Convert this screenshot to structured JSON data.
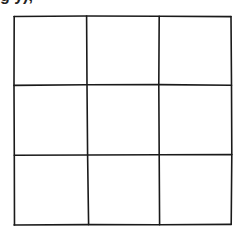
{
  "figure": {
    "type": "empty-grid",
    "rows": 3,
    "columns": 3,
    "line_color": "#1a1a1a",
    "line_width": 1.6,
    "background": "#ffffff",
    "bounds": {
      "left": 14,
      "top": 16,
      "right": 231,
      "bottom": 225
    },
    "vertical_lines_x": [
      14,
      87,
      159,
      231
    ],
    "horizontal_lines_y": [
      16,
      85,
      155,
      225
    ],
    "cells": [
      [
        "",
        "",
        ""
      ],
      [
        "",
        "",
        ""
      ],
      [
        "",
        "",
        ""
      ]
    ]
  },
  "top_fragment": {
    "text": "g         y),"
  }
}
